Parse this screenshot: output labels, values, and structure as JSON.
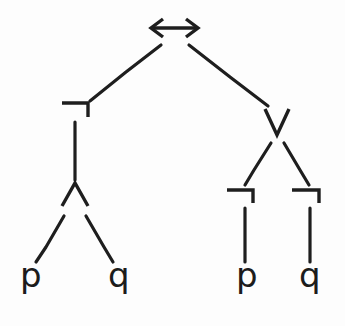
{
  "diagram": {
    "ink_color": "#1e1e1e",
    "background_color": "#fdfdfd",
    "formula": "¬(p ∧ q) ↔ (¬p ∨ ¬q)"
  },
  "nodes": {
    "root": {
      "symbol": "↔",
      "name": "biconditional",
      "x": 174,
      "y": 28
    },
    "left_not": {
      "symbol": "¬",
      "name": "negation",
      "x": 75,
      "y": 110
    },
    "left_and": {
      "symbol": "∧",
      "name": "conjunction",
      "x": 75,
      "y": 193
    },
    "left_leaf_p": {
      "symbol": "p",
      "name": "atom-p",
      "x": 30,
      "y": 277
    },
    "left_leaf_q": {
      "symbol": "q",
      "name": "atom-q",
      "x": 118,
      "y": 277
    },
    "right_or": {
      "symbol": "∨",
      "name": "disjunction",
      "x": 276,
      "y": 121
    },
    "right_not_left": {
      "symbol": "¬",
      "name": "negation",
      "x": 240,
      "y": 194
    },
    "right_not_right": {
      "symbol": "¬",
      "name": "negation",
      "x": 306,
      "y": 194
    },
    "right_leaf_p": {
      "symbol": "p",
      "name": "atom-p",
      "x": 245,
      "y": 277
    },
    "right_leaf_q": {
      "symbol": "q",
      "name": "atom-q",
      "x": 308,
      "y": 277
    }
  },
  "edges": [
    {
      "from": "root",
      "to": "left_not"
    },
    {
      "from": "root",
      "to": "right_or"
    },
    {
      "from": "left_not",
      "to": "left_and"
    },
    {
      "from": "left_and",
      "to": "left_leaf_p"
    },
    {
      "from": "left_and",
      "to": "left_leaf_q"
    },
    {
      "from": "right_or",
      "to": "right_not_left"
    },
    {
      "from": "right_or",
      "to": "right_not_right"
    },
    {
      "from": "right_not_left",
      "to": "right_leaf_p"
    },
    {
      "from": "right_not_right",
      "to": "right_leaf_q"
    }
  ]
}
